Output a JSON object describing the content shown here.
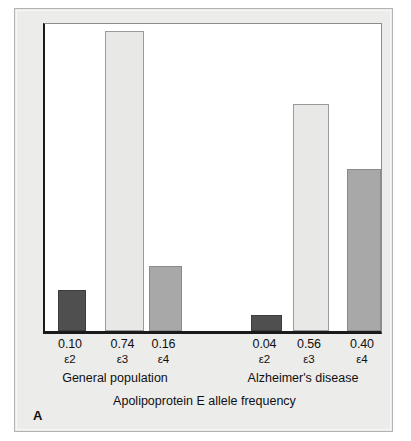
{
  "figure": {
    "panel_letter": "A",
    "axis_caption": "Apolipoprotein E allele frequency"
  },
  "chart_data": {
    "type": "bar",
    "title": "",
    "subtitle": "",
    "xlabel": "Apolipoprotein E allele frequency",
    "ylabel": "",
    "ylim": [
      0,
      0.8
    ],
    "grid": false,
    "legend": "none",
    "groups": [
      {
        "name": "General population",
        "categories": [
          "ε2",
          "ε3",
          "ε4"
        ],
        "values": [
          0.1,
          0.74,
          0.16
        ],
        "value_labels": [
          "0.10",
          "0.74",
          "0.16"
        ],
        "colors": [
          "#4f4f4f",
          "#e8e8e6",
          "#a8a8a8"
        ]
      },
      {
        "name": "Alzheimer's disease",
        "categories": [
          "ε2",
          "ε3",
          "ε4"
        ],
        "values": [
          0.04,
          0.56,
          0.4
        ],
        "value_labels": [
          "0.04",
          "0.56",
          "0.40"
        ],
        "colors": [
          "#4f4f4f",
          "#e8e8e6",
          "#a8a8a8"
        ]
      }
    ],
    "categories": [
      "ε2",
      "ε3",
      "ε4",
      "ε2",
      "ε3",
      "ε4"
    ],
    "values": [
      0.1,
      0.74,
      0.16,
      0.04,
      0.56,
      0.4
    ],
    "series": [
      {
        "name": "Apolipoprotein E allele frequency",
        "values": [
          0.1,
          0.74,
          0.16,
          0.04,
          0.56,
          0.4
        ]
      }
    ],
    "bars": [
      {
        "value_label": "0.10",
        "allele": "ε2",
        "value": 0.1,
        "shade": "dark",
        "left": 13,
        "width": 28
      },
      {
        "value_label": "0.74",
        "allele": "ε3",
        "value": 0.74,
        "shade": "light",
        "left": 60,
        "width": 39
      },
      {
        "value_label": "0.16",
        "allele": "ε4",
        "value": 0.16,
        "shade": "medium",
        "left": 104,
        "width": 33
      },
      {
        "value_label": "0.04",
        "allele": "ε2",
        "value": 0.04,
        "shade": "dark",
        "left": 206,
        "width": 31
      },
      {
        "value_label": "0.56",
        "allele": "ε3",
        "value": 0.56,
        "shade": "light",
        "left": 248,
        "width": 36
      },
      {
        "value_label": "0.40",
        "allele": "ε4",
        "value": 0.4,
        "shade": "medium",
        "left": 302,
        "width": 34
      }
    ],
    "group_labels": [
      {
        "text": "General population",
        "left": 10,
        "width": 180
      },
      {
        "text": "Alzheimer's disease",
        "left": 198,
        "width": 180
      }
    ]
  },
  "colors": {
    "card_background": "#ececeb",
    "plot_background": "#ffffff",
    "axis": "#1a1a1a",
    "bar_dark": "#4f4f4f",
    "bar_light": "#e8e8e6",
    "bar_medium": "#a8a8a8",
    "text": "#101010"
  }
}
